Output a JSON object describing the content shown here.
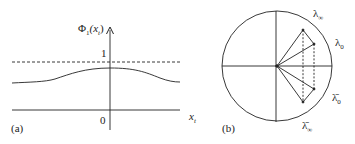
{
  "panel_a": {
    "label": "(a)",
    "y_axis_label": "Φ",
    "y_axis_sub": "1",
    "y_axis_arg": "(x",
    "y_axis_arg_sub": "t",
    "y_axis_arg_close": ")",
    "tick_one": "1",
    "tick_zero": "0",
    "x_axis_label": "x",
    "x_axis_sub": "t"
  },
  "panel_b": {
    "label": "(b)",
    "lambda_inf": "λ",
    "lambda_inf_sub": "∞",
    "lambda_0": "λ",
    "lambda_0_sub": "0",
    "lambda_bar_0": "λ̄",
    "lambda_bar_0_sub": "0",
    "lambda_bar_inf": "λ̄",
    "lambda_bar_inf_sub": "∞"
  },
  "colors": {
    "line": "#222222",
    "background": "#ffffff"
  }
}
